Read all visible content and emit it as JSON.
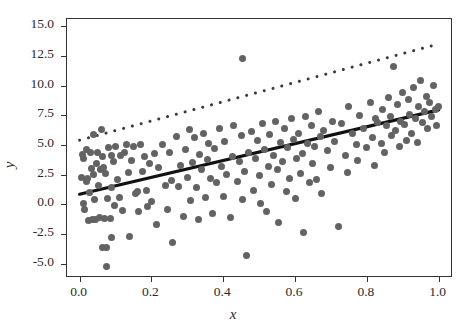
{
  "chart_data": {
    "type": "scatter",
    "title": "",
    "xlabel": "x",
    "ylabel": "y",
    "xlim": [
      -0.035,
      1.04
    ],
    "ylim": [
      -6.2,
      15.6
    ],
    "xticks": [
      0.0,
      0.2,
      0.4,
      0.6,
      0.8,
      1.0
    ],
    "xticklabels": [
      "0.0",
      "0.2",
      "0.4",
      "0.6",
      "0.8",
      "1.0"
    ],
    "yticks": [
      -5.0,
      -2.5,
      0.0,
      2.5,
      5.0,
      7.5,
      10.0,
      12.5,
      15.0
    ],
    "yticklabels": [
      "-5.0",
      "-2.5",
      "0.0",
      "2.5",
      "5.0",
      "7.5",
      "10.0",
      "12.5",
      "15.0"
    ],
    "grid": false,
    "legend": null,
    "marker_color": "#636363",
    "marker_size": 7,
    "series": [
      {
        "name": "observations",
        "type": "scatter",
        "x": [
          0.005,
          0.008,
          0.01,
          0.012,
          0.015,
          0.018,
          0.02,
          0.022,
          0.025,
          0.028,
          0.03,
          0.032,
          0.035,
          0.038,
          0.04,
          0.042,
          0.045,
          0.048,
          0.05,
          0.052,
          0.055,
          0.058,
          0.06,
          0.065,
          0.068,
          0.07,
          0.072,
          0.075,
          0.078,
          0.08,
          0.085,
          0.088,
          0.09,
          0.095,
          0.098,
          0.1,
          0.105,
          0.11,
          0.115,
          0.12,
          0.125,
          0.13,
          0.135,
          0.14,
          0.145,
          0.15,
          0.155,
          0.16,
          0.165,
          0.17,
          0.175,
          0.18,
          0.185,
          0.19,
          0.195,
          0.2,
          0.21,
          0.215,
          0.22,
          0.23,
          0.24,
          0.245,
          0.25,
          0.255,
          0.26,
          0.27,
          0.275,
          0.28,
          0.29,
          0.295,
          0.3,
          0.305,
          0.31,
          0.315,
          0.32,
          0.325,
          0.33,
          0.335,
          0.34,
          0.345,
          0.35,
          0.355,
          0.36,
          0.365,
          0.37,
          0.375,
          0.38,
          0.39,
          0.395,
          0.4,
          0.405,
          0.41,
          0.42,
          0.425,
          0.43,
          0.44,
          0.445,
          0.45,
          0.455,
          0.46,
          0.465,
          0.47,
          0.48,
          0.485,
          0.49,
          0.495,
          0.5,
          0.505,
          0.51,
          0.515,
          0.52,
          0.525,
          0.53,
          0.535,
          0.54,
          0.545,
          0.55,
          0.555,
          0.56,
          0.565,
          0.57,
          0.575,
          0.58,
          0.585,
          0.59,
          0.595,
          0.6,
          0.605,
          0.61,
          0.615,
          0.62,
          0.625,
          0.63,
          0.635,
          0.64,
          0.645,
          0.65,
          0.655,
          0.66,
          0.665,
          0.67,
          0.675,
          0.68,
          0.69,
          0.7,
          0.705,
          0.71,
          0.72,
          0.73,
          0.74,
          0.745,
          0.75,
          0.76,
          0.77,
          0.775,
          0.78,
          0.79,
          0.8,
          0.81,
          0.815,
          0.82,
          0.825,
          0.83,
          0.84,
          0.845,
          0.85,
          0.855,
          0.86,
          0.865,
          0.87,
          0.875,
          0.88,
          0.885,
          0.89,
          0.895,
          0.9,
          0.905,
          0.91,
          0.915,
          0.92,
          0.925,
          0.93,
          0.935,
          0.94,
          0.945,
          0.95,
          0.955,
          0.96,
          0.965,
          0.97,
          0.975,
          0.98,
          0.985,
          0.99,
          0.995,
          1.0,
          0.455,
          0.075,
          0.065,
          0.09
        ],
        "y": [
          2.3,
          4.2,
          3.9,
          0.1,
          -0.4,
          1.9,
          4.6,
          2.2,
          -1.4,
          1.0,
          4.4,
          3.0,
          -1.3,
          5.9,
          2.5,
          0.4,
          -1.3,
          3.4,
          4.4,
          1.6,
          -1.1,
          2.9,
          6.3,
          4.0,
          3.1,
          -1.2,
          2.6,
          -3.6,
          0.5,
          4.8,
          -1.2,
          4.1,
          1.4,
          3.6,
          -0.1,
          4.9,
          2.1,
          0.6,
          4.1,
          -0.5,
          4.4,
          5.0,
          2.7,
          -2.7,
          3.7,
          4.9,
          0.9,
          1.1,
          -0.6,
          5.0,
          2.8,
          4.0,
          1.2,
          -0.2,
          3.4,
          0.2,
          4.3,
          -1.7,
          3.1,
          5.0,
          1.6,
          -0.4,
          4.4,
          2.0,
          -3.2,
          5.7,
          1.5,
          3.3,
          -1.0,
          4.6,
          2.3,
          6.3,
          0.3,
          3.5,
          5.6,
          1.4,
          -1.3,
          4.2,
          2.9,
          6.0,
          0.6,
          3.8,
          5.1,
          2.2,
          -0.8,
          4.7,
          1.8,
          6.4,
          3.2,
          0.7,
          5.3,
          2.5,
          -1.1,
          4.0,
          6.6,
          1.9,
          3.6,
          5.8,
          0.4,
          2.8,
          -4.3,
          4.4,
          6.1,
          1.2,
          3.9,
          5.4,
          2.4,
          0.1,
          6.8,
          4.6,
          -0.6,
          3.2,
          5.9,
          1.7,
          4.1,
          7.0,
          2.9,
          -1.5,
          5.2,
          3.6,
          6.4,
          1.1,
          4.8,
          2.2,
          7.2,
          5.5,
          0.5,
          3.9,
          6.0,
          2.6,
          4.3,
          -2.4,
          7.4,
          5.1,
          1.8,
          6.6,
          3.4,
          4.9,
          2.1,
          7.8,
          5.7,
          0.9,
          6.2,
          4.5,
          3.1,
          7.0,
          5.3,
          -1.9,
          6.8,
          4.1,
          2.7,
          8.2,
          6.0,
          5.0,
          3.7,
          7.5,
          6.4,
          4.8,
          8.6,
          5.6,
          3.3,
          7.2,
          6.9,
          5.1,
          8.0,
          4.4,
          6.6,
          9.0,
          7.4,
          5.8,
          11.6,
          6.2,
          8.4,
          4.9,
          7.0,
          9.4,
          6.7,
          5.4,
          8.8,
          7.6,
          6.0,
          9.8,
          7.2,
          5.2,
          8.2,
          10.4,
          6.9,
          7.8,
          9.1,
          6.4,
          8.6,
          7.4,
          10.0,
          8.0,
          6.6,
          8.2,
          12.3,
          -5.2,
          -3.6,
          -2.8
        ]
      }
    ],
    "fit_lines": [
      {
        "name": "ols-fit",
        "style": "solid",
        "color": "#111111",
        "width": 3.2,
        "x0": 0.0,
        "y0": 0.85,
        "x1": 1.0,
        "y1": 7.95
      },
      {
        "name": "upper-fit",
        "style": "dotted",
        "color": "#3a3a3a",
        "width": 3.0,
        "x0": 0.0,
        "y0": 5.4,
        "x1": 1.0,
        "y1": 13.5
      }
    ]
  }
}
